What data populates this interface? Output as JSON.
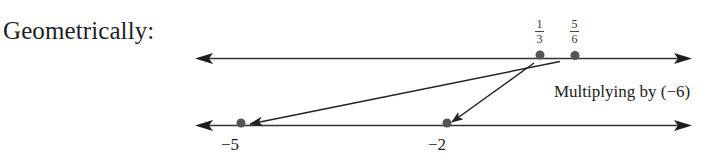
{
  "heading": "Geometrically:",
  "operation_label": "Multiplying by (−6)",
  "colors": {
    "line": "#2a2a2a",
    "dot": "#555555",
    "text": "#222222"
  },
  "top_number_line": {
    "points": [
      {
        "id": "one-third",
        "numerator": "1",
        "denominator": "3",
        "value": 0.3333
      },
      {
        "id": "five-sixths",
        "numerator": "5",
        "denominator": "6",
        "value": 0.8333
      }
    ]
  },
  "bottom_number_line": {
    "points": [
      {
        "id": "minus-five",
        "label": "−5",
        "value": -5
      },
      {
        "id": "minus-two",
        "label": "−2",
        "value": -2
      }
    ]
  },
  "mappings": [
    {
      "from": "1/3",
      "to": "−2"
    },
    {
      "from": "5/6",
      "to": "−5"
    }
  ]
}
